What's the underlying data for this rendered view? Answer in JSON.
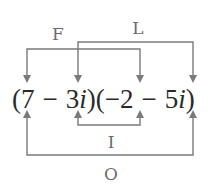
{
  "diagram": {
    "expression": {
      "open1": "(",
      "a": "7",
      "op1": "−",
      "b_coef": "3",
      "b_i": "i",
      "close1": ")",
      "open2": "(",
      "c": "−2",
      "op2": "−",
      "d_coef": "5",
      "d_i": "i",
      "close2": ")"
    },
    "labels": {
      "first": "F",
      "last": "L",
      "inner": "I",
      "outer": "O"
    },
    "colors": {
      "lines": "#7a7a7a",
      "labels": "#6b6b6b",
      "expression": "#2a2a2a"
    }
  }
}
